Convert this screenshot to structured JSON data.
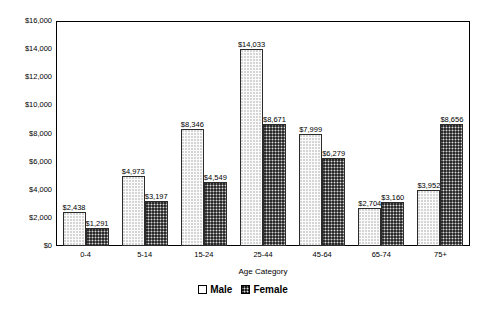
{
  "chart_data": {
    "type": "bar",
    "title": "",
    "xlabel": "Age Category",
    "ylabel": "",
    "ylim": [
      0,
      16000
    ],
    "ytick_step": 2000,
    "grid": false,
    "legend_position": "bottom",
    "categories": [
      "0-4",
      "5-14",
      "15-24",
      "25-44",
      "45-64",
      "65-74",
      "75+"
    ],
    "ytick_labels": [
      "$0",
      "$2,000",
      "$4,000",
      "$6,000",
      "$8,000",
      "$10,000",
      "$12,000",
      "$14,000",
      "$16,000"
    ],
    "ytick_values": [
      0,
      2000,
      4000,
      6000,
      8000,
      10000,
      12000,
      14000,
      16000
    ],
    "series": [
      {
        "name": "Male",
        "values": [
          2438,
          4973,
          8346,
          14033,
          7999,
          2704,
          3952
        ],
        "data_labels": [
          "$2,438",
          "$4,973",
          "$8,346",
          "$14,033",
          "$7,999",
          "$2,704",
          "$3,952"
        ],
        "swatch": "light-dotted"
      },
      {
        "name": "Female",
        "values": [
          1291,
          3197,
          4549,
          8671,
          6279,
          3160,
          8656
        ],
        "data_labels": [
          "$1,291",
          "$3,197",
          "$4,549",
          "$8,671",
          "$6,279",
          "$3,160",
          "$8,656"
        ],
        "swatch": "dark-hatched"
      }
    ]
  },
  "colors": {
    "axis": "#000000",
    "male_fill": "#fbfbfb",
    "female_fill": "#6e6e6e",
    "bar_border": "#2b2b2b",
    "background": "#ffffff"
  }
}
